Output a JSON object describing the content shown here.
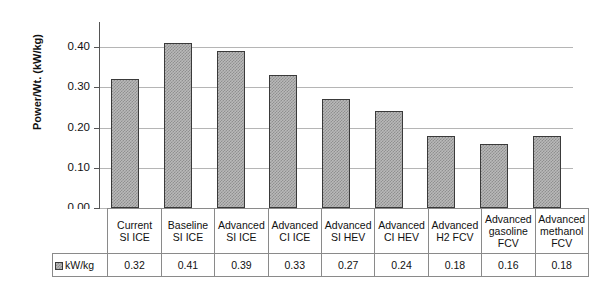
{
  "chart_data": {
    "type": "bar",
    "title": "",
    "xlabel": "",
    "ylabel": "Power/Wt. (kW/kg)",
    "ylim": [
      0.0,
      0.45
    ],
    "ytick_labels": [
      "0.40",
      "0.30",
      "0.20",
      "0.10",
      "0.00"
    ],
    "ytick_values": [
      0.4,
      0.3,
      0.2,
      0.1,
      0.0
    ],
    "grid": true,
    "legend_position": "bottom-left",
    "legend_entries": [
      "kW/kg"
    ],
    "series_name": "kW/kg",
    "categories": [
      "Current SI ICE",
      "Baseline SI ICE",
      "Advanced SI ICE",
      "Advanced CI ICE",
      "Advanced SI HEV",
      "Advanced CI HEV",
      "Advanced H2 FCV",
      "Advanced gasoline FCV",
      "Advanced methanol FCV"
    ],
    "category_lines": [
      [
        "Current",
        "SI ICE"
      ],
      [
        "Baseline",
        "SI ICE"
      ],
      [
        "Advanced",
        "SI ICE"
      ],
      [
        "Advanced",
        "CI ICE"
      ],
      [
        "Advanced",
        "SI HEV"
      ],
      [
        "Advanced",
        "CI HEV"
      ],
      [
        "Advanced",
        "H2 FCV"
      ],
      [
        "Advanced",
        "gasoline",
        "FCV"
      ],
      [
        "Advanced",
        "methanol",
        "FCV"
      ]
    ],
    "values": [
      0.32,
      0.41,
      0.39,
      0.33,
      0.27,
      0.24,
      0.18,
      0.16,
      0.18
    ],
    "value_labels": [
      "0.32",
      "0.41",
      "0.39",
      "0.33",
      "0.27",
      "0.24",
      "0.18",
      "0.16",
      "0.18"
    ],
    "bar_fill_color": "#b9b9b9",
    "bar_hatch_color": "#8f8f8f",
    "bar_edge_color": "#3a3a3a",
    "grid_color": "#b5b5b5",
    "axis_color": "#555555"
  },
  "table": {
    "legend_row_label": "kW/kg",
    "legend_swatch": "hatched-square-icon"
  }
}
